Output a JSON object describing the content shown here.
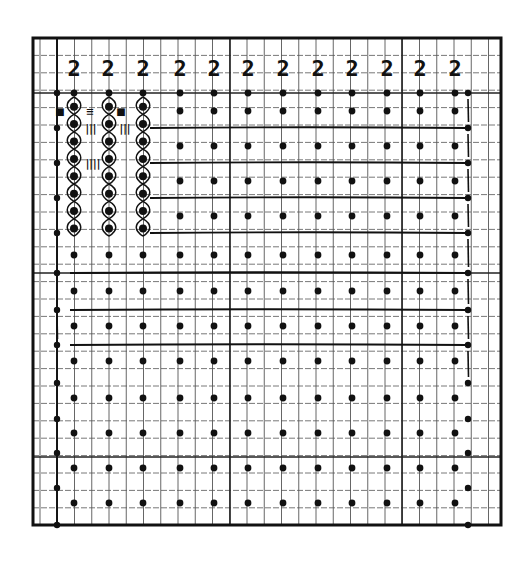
{
  "diagram": {
    "type": "knitting-chart",
    "frame": {
      "left": 33,
      "top": 38,
      "right": 501,
      "bottom": 525,
      "color": "#111111"
    },
    "grid": {
      "col_start": 40,
      "col_step": 17.25,
      "col_count": 27,
      "row_start": 38,
      "row_step": 17.4,
      "row_count": 28,
      "line_color": "#555555",
      "major_vertical_x": [
        57,
        230,
        402
      ],
      "major_horizontal_y": [
        93,
        273,
        457
      ]
    },
    "header_row": {
      "glyph": "2",
      "y": 76,
      "x_positions": [
        74,
        108,
        143,
        180,
        214,
        248,
        283,
        318,
        352,
        387,
        420,
        455
      ]
    },
    "dot_columns_x": [
      74,
      109,
      143,
      180,
      214,
      248,
      283,
      318,
      352,
      387,
      420,
      455
    ],
    "dot_rows_y": [
      93,
      111,
      146,
      181,
      216,
      255,
      291,
      326,
      361,
      398,
      433,
      468,
      503
    ],
    "left_edge": {
      "x": 57,
      "dot_rows_y": [
        93,
        128,
        163,
        198,
        233,
        273,
        310,
        345,
        383,
        419,
        453,
        488,
        525
      ]
    },
    "right_edge": {
      "x": 468,
      "dot_rows_y": [
        93,
        128,
        163,
        198,
        233,
        273,
        310,
        345,
        383,
        419,
        453,
        488,
        525
      ]
    },
    "carry_lines_y": [
      128,
      163,
      198,
      233,
      273,
      310,
      345
    ],
    "cable_columns": {
      "x": [
        74,
        109,
        143
      ],
      "y_start": 93,
      "y_end": 222,
      "twist_step": 17.4
    },
    "annotations": [
      {
        "symbol": "■",
        "x": 60,
        "y": 111
      },
      {
        "symbol": "≡",
        "x": 90,
        "y": 111
      },
      {
        "symbol": "■",
        "x": 121,
        "y": 111
      },
      {
        "symbol": "|||",
        "x": 91,
        "y": 128
      },
      {
        "symbol": "|||",
        "x": 125,
        "y": 128
      },
      {
        "symbol": "||||",
        "x": 93,
        "y": 163
      }
    ]
  }
}
